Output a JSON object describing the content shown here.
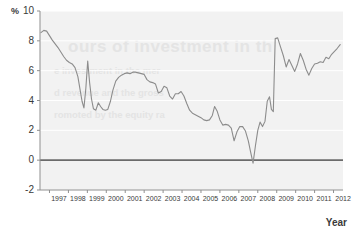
{
  "chart_data": {
    "type": "line",
    "title": "",
    "xlabel": "Year",
    "ylabel": "%",
    "unit_label": "%",
    "xlim": [
      1996.5,
      2012.5
    ],
    "ylim": [
      -2,
      10
    ],
    "grid": true,
    "legend": null,
    "zero_line": 0,
    "yticks": [
      10,
      8,
      6,
      4,
      2,
      0,
      -2
    ],
    "ytick_labels": [
      "10",
      "8",
      "6",
      "4",
      "2",
      "0",
      "-2"
    ],
    "xticks": [
      1997,
      1998,
      1999,
      2000,
      2001,
      2002,
      2003,
      2004,
      2005,
      2006,
      2007,
      2008,
      2009,
      2010,
      2011,
      2012
    ],
    "xtick_labels": [
      "1997",
      "1998",
      "1999",
      "2000",
      "2001",
      "2002",
      "2003",
      "2004",
      "2005",
      "2006",
      "2007",
      "2008",
      "2009",
      "2010",
      "2011",
      "2012"
    ],
    "series": [
      {
        "name": "rate",
        "color": "#8c8c8c",
        "x": [
          1996.55,
          1996.7,
          1996.85,
          1997.0,
          1997.15,
          1997.3,
          1997.45,
          1997.6,
          1997.75,
          1997.9,
          1998.05,
          1998.2,
          1998.35,
          1998.5,
          1998.62,
          1998.72,
          1998.82,
          1998.92,
          1999.02,
          1999.12,
          1999.22,
          1999.32,
          1999.45,
          1999.58,
          1999.7,
          1999.82,
          1999.95,
          2000.08,
          2000.22,
          2000.35,
          2000.5,
          2000.65,
          2000.8,
          2000.95,
          2001.1,
          2001.25,
          2001.4,
          2001.55,
          2001.7,
          2001.85,
          2002.0,
          2002.15,
          2002.3,
          2002.45,
          2002.6,
          2002.75,
          2002.9,
          2003.05,
          2003.2,
          2003.35,
          2003.5,
          2003.65,
          2003.8,
          2003.95,
          2004.1,
          2004.25,
          2004.4,
          2004.55,
          2004.7,
          2004.85,
          2005.0,
          2005.15,
          2005.3,
          2005.45,
          2005.6,
          2005.72,
          2005.85,
          2006.0,
          2006.15,
          2006.3,
          2006.45,
          2006.6,
          2006.75,
          2006.9,
          2007.05,
          2007.2,
          2007.35,
          2007.5,
          2007.62,
          2007.75,
          2007.88,
          2008.0,
          2008.12,
          2008.25,
          2008.38,
          2008.5,
          2008.62,
          2008.72,
          2008.82,
          2008.92,
          2009.05,
          2009.2,
          2009.35,
          2009.5,
          2009.65,
          2009.8,
          2009.95,
          2010.1,
          2010.25,
          2010.4,
          2010.55,
          2010.7,
          2010.85,
          2011.0,
          2011.15,
          2011.3,
          2011.45,
          2011.6,
          2011.75,
          2011.9,
          2012.05,
          2012.2,
          2012.35
        ],
        "y": [
          8.55,
          8.7,
          8.65,
          8.35,
          8.05,
          7.8,
          7.55,
          7.25,
          6.95,
          6.7,
          6.55,
          6.45,
          6.2,
          5.6,
          4.7,
          3.95,
          3.5,
          4.8,
          6.65,
          5.2,
          4.1,
          3.45,
          3.35,
          3.85,
          3.6,
          3.4,
          3.35,
          3.4,
          3.95,
          4.7,
          5.3,
          5.55,
          5.7,
          5.8,
          5.85,
          5.8,
          5.9,
          5.9,
          5.85,
          5.8,
          5.75,
          5.4,
          5.25,
          5.2,
          5.1,
          4.5,
          4.6,
          4.95,
          4.85,
          4.3,
          4.1,
          4.45,
          4.45,
          4.6,
          4.3,
          3.8,
          3.35,
          3.15,
          3.05,
          2.95,
          2.85,
          2.7,
          2.65,
          2.7,
          3.0,
          3.6,
          3.3,
          2.7,
          2.35,
          2.4,
          2.35,
          2.15,
          1.3,
          1.9,
          2.25,
          2.25,
          1.95,
          1.3,
          0.55,
          -0.2,
          1.0,
          2.0,
          2.55,
          2.25,
          2.6,
          3.95,
          4.25,
          3.4,
          3.25,
          8.15,
          8.2,
          7.6,
          7.0,
          6.25,
          6.75,
          6.35,
          5.95,
          6.45,
          7.15,
          6.7,
          6.1,
          5.7,
          6.15,
          6.45,
          6.5,
          6.6,
          6.55,
          6.9,
          6.8,
          7.1,
          7.3,
          7.5,
          7.75
        ]
      }
    ]
  },
  "watermark": {
    "line1": "ours of investment in th",
    "line2": "e investment in the mer",
    "line3": "d revenue and the gross",
    "line4": "romoted by the equity ra"
  }
}
